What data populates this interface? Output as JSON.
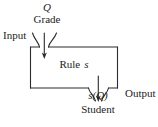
{
  "diagram": {
    "stroke_color": "#2b2b2b",
    "text_color": "#232323",
    "background_color": "#ffffff",
    "labels": {
      "question": "Q",
      "grade": "Grade",
      "input": "Input",
      "rule_word": "Rule",
      "rule_variable": "s",
      "student_score": "s(Q)",
      "student": "Student",
      "output": "Output"
    },
    "nodes": [
      {
        "name": "input-brace",
        "role": "input funnel",
        "label": "Input"
      },
      {
        "name": "rule-box",
        "role": "process",
        "label": "Rule s"
      },
      {
        "name": "output-brace",
        "role": "output funnel",
        "label": "Output"
      }
    ],
    "flow": [
      {
        "from": "Q / Grade",
        "to": "Rule s",
        "direction": "down"
      },
      {
        "from": "Rule s",
        "to": "s(Q) / Student",
        "direction": "down"
      }
    ]
  }
}
